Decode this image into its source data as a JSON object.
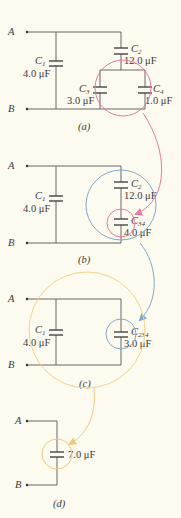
{
  "colors": {
    "background": "#fdfbf0",
    "wire": "#555555",
    "pink": "#e8799f",
    "blue": "#7fa8cc",
    "yellow": "#f0d48c",
    "orange": "#f2c77c"
  },
  "terminals": {
    "a": "A",
    "b": "B"
  },
  "panels": {
    "a": {
      "label": "(a)",
      "c1": {
        "name": "C",
        "sub": "1",
        "value": "4.0 μF"
      },
      "c2": {
        "name": "C",
        "sub": "2",
        "value": "12.0 μF"
      },
      "c3": {
        "name": "C",
        "sub": "3",
        "value": "3.0 μF"
      },
      "c4": {
        "name": "C",
        "sub": "4",
        "value": "1.0 μF"
      }
    },
    "b": {
      "label": "(b)",
      "c1": {
        "name": "C",
        "sub": "1",
        "value": "4.0 μF"
      },
      "c2": {
        "name": "C",
        "sub": "2",
        "value": "12.0 μF"
      },
      "c34": {
        "name": "C",
        "sub": "34",
        "value": "4.0 μF"
      }
    },
    "c": {
      "label": "(c)",
      "c1": {
        "name": "C",
        "sub": "1",
        "value": "4.0 μF"
      },
      "c234": {
        "name": "C",
        "sub": "234",
        "value": "3.0 μF"
      }
    },
    "d": {
      "label": "(d)",
      "ceq": {
        "value": "7.0 μF"
      }
    }
  }
}
